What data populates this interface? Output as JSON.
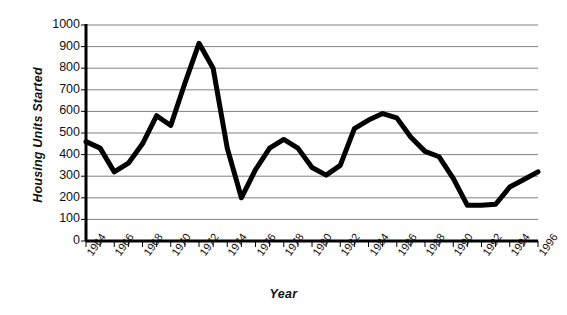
{
  "chart_data": {
    "type": "line",
    "title": "",
    "xlabel": "Year",
    "ylabel": "Housing Units Started",
    "xlim": [
      1964,
      1996
    ],
    "ylim": [
      0,
      1000
    ],
    "ytick_step": 100,
    "grid": true,
    "legend": false,
    "line_color": "#000000",
    "grid_color": "#808080",
    "axis_color": "#000000",
    "background": "#ffffff",
    "x": [
      1964,
      1965,
      1966,
      1967,
      1968,
      1969,
      1970,
      1971,
      1972,
      1973,
      1974,
      1975,
      1976,
      1977,
      1978,
      1979,
      1980,
      1981,
      1982,
      1983,
      1984,
      1985,
      1986,
      1987,
      1988,
      1989,
      1990,
      1991,
      1992,
      1993,
      1994,
      1995,
      1996
    ],
    "values": [
      460,
      430,
      320,
      360,
      450,
      580,
      535,
      730,
      915,
      800,
      430,
      200,
      330,
      430,
      470,
      430,
      340,
      305,
      350,
      520,
      560,
      590,
      570,
      480,
      415,
      390,
      290,
      165,
      165,
      170,
      250,
      285,
      320
    ],
    "ytick_labels": [
      "0",
      "100",
      "200",
      "300",
      "400",
      "500",
      "600",
      "700",
      "800",
      "900",
      "1000"
    ],
    "xtick_labels": [
      "1964",
      "1966",
      "1968",
      "1970",
      "1972",
      "1974",
      "1976",
      "1978",
      "1980",
      "1982",
      "1984",
      "1986",
      "1988",
      "1990",
      "1992",
      "1994",
      "1996"
    ],
    "xtick_label_years": [
      1964,
      1966,
      1968,
      1970,
      1972,
      1974,
      1976,
      1978,
      1980,
      1982,
      1984,
      1986,
      1988,
      1990,
      1992,
      1994,
      1996
    ],
    "minor_tick_years": [
      1964,
      1965,
      1966,
      1967,
      1968,
      1969,
      1970,
      1971,
      1972,
      1973,
      1974,
      1975,
      1976,
      1977,
      1978,
      1979,
      1980,
      1981,
      1982,
      1983,
      1984,
      1985,
      1986,
      1987,
      1988,
      1989,
      1990,
      1991,
      1992,
      1993,
      1994,
      1995,
      1996
    ]
  }
}
